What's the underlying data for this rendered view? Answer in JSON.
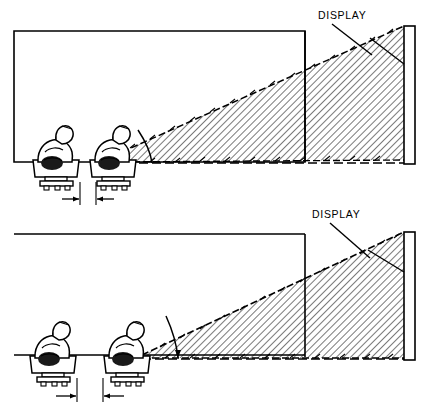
{
  "figure": {
    "width": 427,
    "height": 420,
    "background_color": "#ffffff",
    "line_color": "#000000",
    "hatch_color": "#000000"
  },
  "panels": [
    {
      "id": "upper-panel",
      "name": "close-seating-configuration",
      "display_label": "DISPLAY",
      "operator_count": 2,
      "operators": [
        {
          "name": "operator-left",
          "seat_index": 1
        },
        {
          "name": "operator-right",
          "seat_index": 2
        }
      ],
      "dimension": {
        "name": "seat-separation-dimension",
        "label": "",
        "arrow_style": "inward-double-arrow"
      },
      "view_cone": {
        "name": "field-of-view-cone",
        "hatched": true,
        "boundary_style": "arrow-tipped-dashed"
      },
      "angle_marker": {
        "name": "viewing-angle-arc",
        "label": ""
      }
    },
    {
      "id": "lower-panel",
      "name": "wide-seating-configuration",
      "display_label": "DISPLAY",
      "operator_count": 2,
      "operators": [
        {
          "name": "operator-left",
          "seat_index": 1
        },
        {
          "name": "operator-right",
          "seat_index": 2
        }
      ],
      "dimension": {
        "name": "seat-separation-dimension",
        "label": "",
        "arrow_style": "inward-double-arrow"
      },
      "view_cone": {
        "name": "field-of-view-cone",
        "hatched": true,
        "boundary_style": "arrow-tipped-dashed"
      },
      "angle_marker": {
        "name": "viewing-angle-arc",
        "label": ""
      }
    }
  ]
}
